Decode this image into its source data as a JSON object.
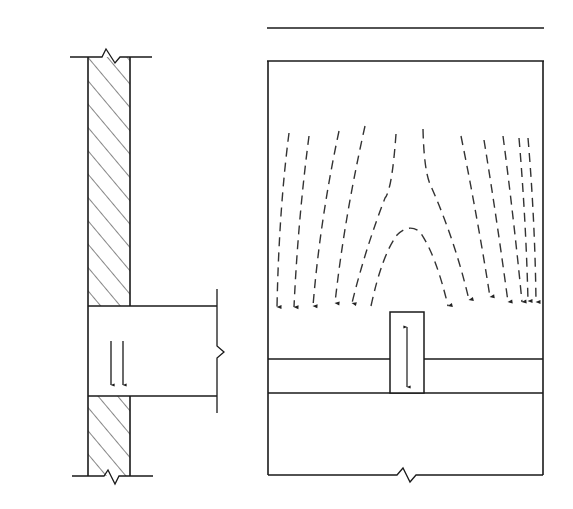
{
  "figure": {
    "type": "structural-mechanics-diagram",
    "left_panel": {
      "description": "Wall section with beam end bearing",
      "labels": {
        "psi": "ψ",
        "N": "N",
        "zero": "0",
        "Nl_main": "N",
        "Nl_sub": "l"
      }
    },
    "right_panel": {
      "description": "Stress flow in wall under concentrated load from beam bearing",
      "labels": {
        "sigma": "σ",
        "sigma_sub": "0",
        "Nl_main": "N",
        "Nl_sub": "l"
      },
      "top_load_arrow_count": 19,
      "bearing_load_arrow_count_left": 7,
      "bearing_load_arrow_count_right": 7,
      "flow_line_count": 12
    },
    "colors": {
      "stroke": "#1a1a1a",
      "background": "#ffffff",
      "dash": "#333333"
    }
  }
}
